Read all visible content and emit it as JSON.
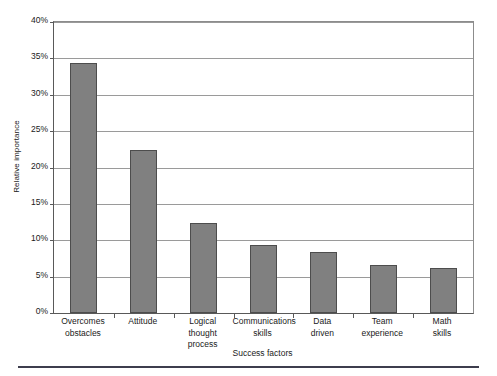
{
  "chart_data": {
    "type": "bar",
    "title": "",
    "xlabel": "Success factors",
    "ylabel": "Relative importance",
    "categories": [
      "Overcomes obstacles",
      "Attitude",
      "Logical thought process",
      "Communications skills",
      "Data driven",
      "Team experience",
      "Math skills"
    ],
    "category_lines": [
      [
        "Overcomes",
        "obstacles"
      ],
      [
        "Attitude",
        ""
      ],
      [
        "Logical",
        "thought process"
      ],
      [
        "Communications",
        "skills"
      ],
      [
        "Data",
        "driven"
      ],
      [
        "Team",
        "experience"
      ],
      [
        "Math",
        "skills"
      ]
    ],
    "values": [
      34.3,
      22.4,
      12.4,
      9.3,
      8.4,
      6.6,
      6.2
    ],
    "value_labels": [
      "34.3%",
      "22.4%",
      "12.4%",
      "9.3%",
      "8.4%",
      "6.6%",
      "6.2%"
    ],
    "ylim": [
      0,
      40
    ],
    "ytick_values": [
      0,
      5,
      10,
      15,
      20,
      25,
      30,
      35,
      40
    ],
    "ytick_labels": [
      "0%",
      "5%",
      "10%",
      "15%",
      "20%",
      "25%",
      "30%",
      "35%",
      "40%"
    ],
    "grid": true,
    "legend": null,
    "bar_color": "#808080",
    "bar_border_color": "#4d4d4d",
    "gridline_color": "#9a9a9a",
    "axis_color": "#595959"
  }
}
